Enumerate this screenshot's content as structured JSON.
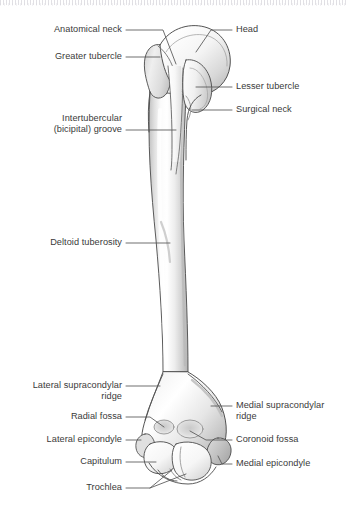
{
  "figure": {
    "view": "anterior",
    "style": "grayscale-line-drawing",
    "background_color": "#ffffff",
    "label_text_color": "#3a3a3a",
    "leader_line_color": "#555555",
    "bone_outline_color": "#4a4a4a",
    "bone_fill_light": "#ffffff",
    "bone_fill_mid": "#e4e4e4",
    "bone_fill_shadow": "#bdbdbd",
    "caption": ""
  },
  "labels": {
    "left": [
      {
        "id": "anatomical-neck",
        "text": "Anatomical neck"
      },
      {
        "id": "greater-tubercle",
        "text": "Greater tubercle"
      },
      {
        "id": "intertubercular-groove",
        "text": "Intertubercular\n(bicipital) groove"
      },
      {
        "id": "deltoid-tuberosity",
        "text": "Deltoid tuberosity"
      },
      {
        "id": "lateral-supracondylar-ridge",
        "text": "Lateral supracondylar\nridge"
      },
      {
        "id": "radial-fossa",
        "text": "Radial fossa"
      },
      {
        "id": "lateral-epicondyle",
        "text": "Lateral epicondyle"
      },
      {
        "id": "capitulum",
        "text": "Capitulum"
      },
      {
        "id": "trochlea",
        "text": "Trochlea"
      }
    ],
    "right": [
      {
        "id": "head",
        "text": "Head"
      },
      {
        "id": "lesser-tubercle",
        "text": "Lesser tubercle"
      },
      {
        "id": "surgical-neck",
        "text": "Surgical neck"
      },
      {
        "id": "medial-supracondylar-ridge",
        "text": "Medial supracondylar\nridge"
      },
      {
        "id": "coronoid-fossa",
        "text": "Coronoid fossa"
      },
      {
        "id": "medial-epicondyle",
        "text": "Medial epicondyle"
      }
    ]
  }
}
